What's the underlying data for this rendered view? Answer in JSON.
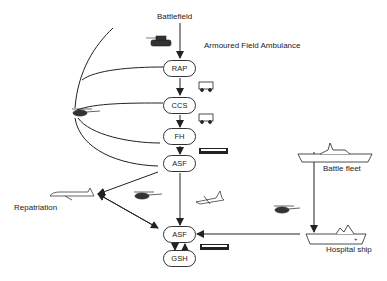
{
  "labels": {
    "battlefield": "Battlefield",
    "armoured_ambulance": "Armoured Field Ambulance",
    "repatriation": "Repatriation",
    "battle_fleet": "Battle fleet",
    "hospital_ship": "Hospital ship"
  },
  "nodes": [
    {
      "id": "rap",
      "label": "RAP"
    },
    {
      "id": "ccs",
      "label": "CCS"
    },
    {
      "id": "fh",
      "label": "FH"
    },
    {
      "id": "asf1",
      "label": "ASF"
    },
    {
      "id": "asf2",
      "label": "ASF"
    },
    {
      "id": "gsh",
      "label": "GSH"
    }
  ],
  "icons": [
    "tank-icon",
    "ambulance-icon",
    "helicopter-icon",
    "bus-icon",
    "airliner-icon",
    "transport-plane-icon",
    "warship-icon",
    "hospital-ship-icon"
  ],
  "colors": {
    "line": "#222222",
    "background": "#ffffff"
  }
}
